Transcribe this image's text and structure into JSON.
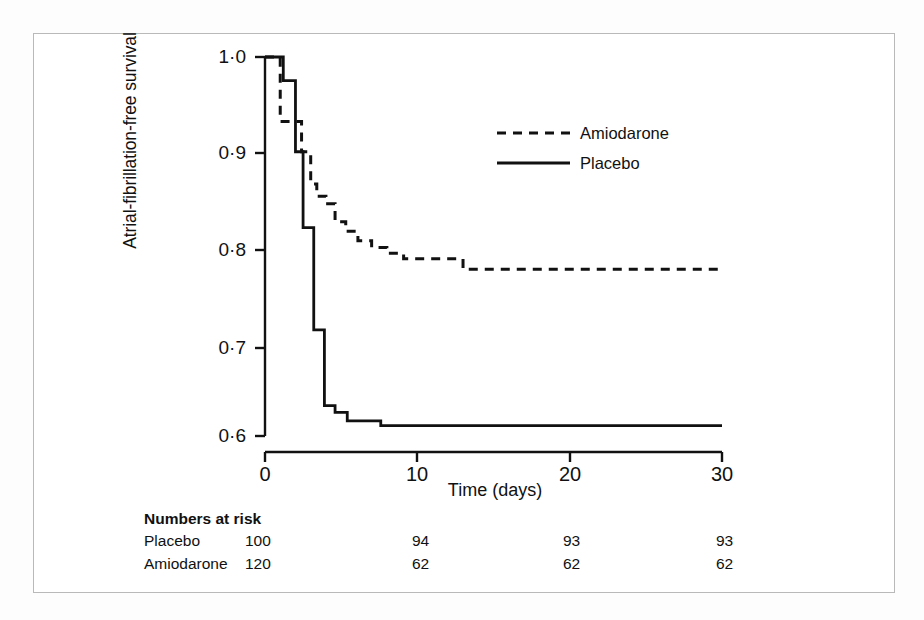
{
  "figure": {
    "background_color": "#ffffff",
    "frame_color": "#b9b9b9",
    "line_color": "#111111"
  },
  "chart_data": {
    "type": "line",
    "title": "",
    "xlabel": "Time (days)",
    "ylabel": "Atrial-fibrillation-free survival",
    "xlim": [
      0,
      30
    ],
    "ylim": [
      0.6,
      1.0
    ],
    "xticks": [
      0,
      10,
      20,
      30
    ],
    "xticklabels": [
      "0",
      "10",
      "20",
      "30"
    ],
    "yticks": [
      0.6,
      0.7,
      0.8,
      0.9,
      1.0
    ],
    "yticklabels": [
      "0·6",
      "0·7",
      "0·8",
      "0·9",
      "1·0"
    ],
    "grid": false,
    "legend_position": "upper-center-right",
    "series": [
      {
        "name": "Amiodarone",
        "style": "dashed",
        "x": [
          0,
          1.0,
          1.0,
          2.4,
          2.4,
          3.0,
          3.0,
          3.4,
          3.4,
          4.0,
          4.0,
          4.6,
          4.6,
          5.3,
          5.3,
          6.1,
          6.1,
          7.0,
          7.0,
          8.0,
          8.0,
          9.1,
          9.1,
          13.0,
          13.0,
          30.0
        ],
        "y": [
          1.0,
          1.0,
          0.932,
          0.932,
          0.9,
          0.9,
          0.866,
          0.866,
          0.853,
          0.853,
          0.845,
          0.845,
          0.826,
          0.826,
          0.816,
          0.816,
          0.806,
          0.806,
          0.799,
          0.799,
          0.793,
          0.793,
          0.787,
          0.787,
          0.776,
          0.776
        ]
      },
      {
        "name": "Placebo",
        "style": "solid",
        "x": [
          0,
          1.2,
          1.2,
          2.0,
          2.0,
          2.5,
          2.5,
          3.2,
          3.2,
          3.9,
          3.9,
          4.6,
          4.6,
          5.4,
          5.4,
          7.6,
          7.6,
          30.0
        ],
        "y": [
          1.0,
          1.0,
          0.975,
          0.975,
          0.9,
          0.9,
          0.82,
          0.82,
          0.712,
          0.712,
          0.632,
          0.632,
          0.625,
          0.625,
          0.616,
          0.616,
          0.611,
          0.611
        ]
      }
    ],
    "legend": [
      {
        "label": "Amiodarone",
        "style": "dashed"
      },
      {
        "label": "Placebo",
        "style": "solid"
      }
    ]
  },
  "numbers_at_risk": {
    "title": "Numbers at risk",
    "time_points": [
      0,
      10,
      20,
      30
    ],
    "rows": [
      {
        "name": "Placebo",
        "values": [
          "100",
          "94",
          "93",
          "93"
        ]
      },
      {
        "name": "Amiodarone",
        "values": [
          "120",
          "62",
          "62",
          "62"
        ]
      }
    ]
  }
}
